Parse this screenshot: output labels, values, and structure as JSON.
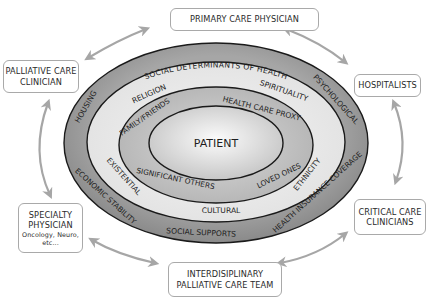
{
  "diagram": {
    "center": {
      "label": "PATIENT"
    },
    "rings": [
      {
        "name": "inner-ring",
        "labels": {
          "top_left": "FAMILY/FRIENDS",
          "top_right": "HEALTH CARE PROXY",
          "bottom_left": "SIGNIFICANT OTHERS",
          "bottom_right": "LOVED ONES"
        }
      },
      {
        "name": "middle-ring",
        "labels": {
          "top_left": "RELIGION",
          "top_right": "SPIRITUALITY",
          "left": "EXISTENTIAL",
          "bottom": "CULTURAL",
          "right": "ETHNICITY"
        }
      },
      {
        "name": "outer-ring",
        "labels": {
          "top": "SOCIAL DETERMINANTS OF HEALTH",
          "top_left": "HOUSING",
          "top_right": "PSYCHOLOGICAL",
          "bottom_left": "ECONOMIC STABILITY",
          "bottom": "SOCIAL SUPPORTS",
          "bottom_right": "HEALTH INSURANCE COVERAGE"
        }
      }
    ],
    "nodes": {
      "primary_care": {
        "line1": "PRIMARY CARE PHYSICIAN"
      },
      "palliative_clinician": {
        "line1": "PALLIATIVE CARE",
        "line2": "CLINICIAN"
      },
      "hospitalists": {
        "line1": "HOSPITALISTS"
      },
      "specialty": {
        "line1": "SPECIALTY",
        "line2": "PHYSICIAN",
        "line3": "Oncology, Neuro,",
        "line4": "etc..."
      },
      "critical_care": {
        "line1": "CRITICAL CARE",
        "line2": "CLINICIANS"
      },
      "interdisciplinary": {
        "line1": "INTERDISIPLINARY",
        "line2": "PALLIATIVE CARE TEAM"
      }
    },
    "colors": {
      "outer_ring": "#9a9a9a",
      "middle_ring": "#e6e6e6",
      "inner_ring": "#bdbdbd",
      "center_light": "#fafafa",
      "center_dark": "#c4c4c4",
      "stroke": "#1a1a1a",
      "arrow": "#a6a6a6",
      "box_border": "#a9a9a9",
      "text": "#2a2a2a"
    }
  }
}
